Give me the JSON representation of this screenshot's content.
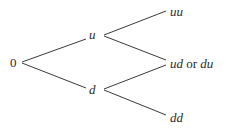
{
  "diagram": {
    "type": "binomial-tree",
    "nodes": {
      "root": {
        "label": "0"
      },
      "up": {
        "label": "u"
      },
      "down": {
        "label": "d"
      },
      "up_up": {
        "label": "uu"
      },
      "mixed": {
        "label_a": "ud",
        "connector": "or",
        "label_b": "du"
      },
      "down_down": {
        "label": "dd"
      }
    },
    "edges": [
      {
        "from": "0",
        "to": "u"
      },
      {
        "from": "0",
        "to": "d"
      },
      {
        "from": "u",
        "to": "uu"
      },
      {
        "from": "u",
        "to": "ud or du"
      },
      {
        "from": "d",
        "to": "ud or du"
      },
      {
        "from": "d",
        "to": "dd"
      }
    ],
    "colors": {
      "line": "#3a3a3a",
      "text": "#2a2a2a",
      "background": "#ffffff"
    }
  }
}
